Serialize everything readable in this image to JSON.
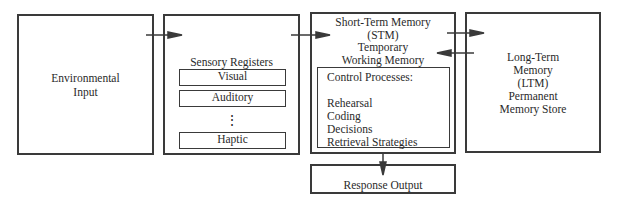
{
  "diagram": {
    "environmental_input": {
      "lines": [
        "Environmental",
        "Input"
      ]
    },
    "sensory_registers": {
      "title": "Sensory Registers",
      "registers": [
        "Visual",
        "Auditory",
        "Haptic"
      ],
      "ellipsis": "⋮"
    },
    "short_term_memory": {
      "lines": [
        "Short-Term Memory",
        "(STM)",
        "Temporary",
        "Working Memory"
      ],
      "control_processes": {
        "title": "Control Processes:",
        "items": [
          "Rehearsal",
          "Coding",
          "Decisions",
          "Retrieval Strategies"
        ]
      }
    },
    "long_term_memory": {
      "lines": [
        "Long-Term",
        "Memory",
        "(LTM)",
        "Permanent",
        "Memory Store"
      ]
    },
    "response_output": {
      "label": "Response Output"
    },
    "arrows": [
      {
        "from": "environmental_input",
        "to": "sensory_registers"
      },
      {
        "from": "sensory_registers",
        "to": "short_term_memory"
      },
      {
        "from": "short_term_memory",
        "to": "long_term_memory"
      },
      {
        "from": "long_term_memory",
        "to": "short_term_memory"
      },
      {
        "from": "short_term_memory",
        "to": "response_output"
      }
    ],
    "colors": {
      "stroke": "#3a3a3a",
      "text": "#2a2a2a",
      "background": "#ffffff"
    }
  }
}
